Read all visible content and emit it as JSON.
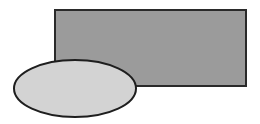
{
  "canvas": {
    "width": 260,
    "height": 124,
    "background": "#ffffff"
  },
  "shapes": {
    "rectangle": {
      "x": 55,
      "y": 10,
      "width": 191,
      "height": 76,
      "fill": "#9b9b9b",
      "stroke": "#2a2a2a",
      "stroke_width": 2
    },
    "ellipse": {
      "cx": 75,
      "cy": 88.5,
      "rx": 61,
      "ry": 28.5,
      "fill": "#d3d3d3",
      "stroke": "#1e1e1e",
      "stroke_width": 2
    }
  }
}
